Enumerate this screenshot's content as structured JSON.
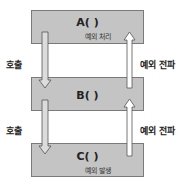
{
  "boxes": [
    {
      "name": "A( )",
      "note": "예외 처리"
    },
    {
      "name": "B( )",
      "note": ""
    },
    {
      "name": "C( )",
      "note": "예외 발생"
    }
  ],
  "left_labels": [
    "호출",
    "호출"
  ],
  "right_labels": [
    "예외 전파",
    "예외 전파"
  ],
  "colors": {
    "box_fill": "#c4c4c4",
    "box_border": "#7a7a7a",
    "arrow_fill": "#ffffff"
  }
}
